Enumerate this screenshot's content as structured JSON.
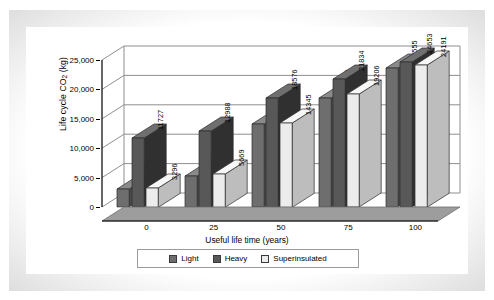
{
  "chart_data": {
    "type": "bar",
    "title": "",
    "xlabel": "Useful life time (years)",
    "ylabel": "Life cycle CO2 (kg)",
    "ylabel_parts": {
      "pre": "Life cycle CO",
      "sub": "2",
      "post": " (kg)"
    },
    "categories": [
      "0",
      "25",
      "50",
      "75",
      "100"
    ],
    "ylim": [
      0,
      25000
    ],
    "yticks": [
      "0",
      "5,000",
      "10,000",
      "15,000",
      "20,000",
      "25,000"
    ],
    "ytick_values": [
      0,
      5000,
      10000,
      15000,
      20000,
      25000
    ],
    "grid": true,
    "legend_position": "bottom",
    "projection": "3d-grouped-column",
    "series": [
      {
        "name": "Light",
        "color": "#6e6e6e",
        "values": [
          3050,
          11727,
          14095,
          18569,
          23555
        ]
      },
      {
        "name": "Heavy",
        "color": "#585858",
        "values": [
          11727,
          12988,
          18576,
          21834,
          24653
        ]
      },
      {
        "name": "Superinsulated",
        "color": "#ececec",
        "values": [
          3296,
          5669,
          14345,
          19206,
          24191
        ]
      }
    ],
    "groups": [
      {
        "category": "0",
        "bars": [
          {
            "series": "Light",
            "value": 3050,
            "label": "3050"
          },
          {
            "series": "Heavy",
            "value": 11727,
            "label": "11727"
          },
          {
            "series": "Superinsulated",
            "value": 3296,
            "label": "3296"
          }
        ]
      },
      {
        "category": "25",
        "bars": [
          {
            "series": "Light",
            "value": 5320,
            "label": "5320"
          },
          {
            "series": "Heavy",
            "value": 12988,
            "label": "12988"
          },
          {
            "series": "Superinsulated",
            "value": 5669,
            "label": "5669"
          }
        ]
      },
      {
        "category": "50",
        "bars": [
          {
            "series": "Light",
            "value": 14095,
            "label": "14095"
          },
          {
            "series": "Heavy",
            "value": 18576,
            "label": "18576"
          },
          {
            "series": "Superinsulated",
            "value": 14345,
            "label": "14345"
          }
        ]
      },
      {
        "category": "75",
        "bars": [
          {
            "series": "Light",
            "value": 18569,
            "label": "18569"
          },
          {
            "series": "Heavy",
            "value": 21834,
            "label": "21834"
          },
          {
            "series": "Superinsulated",
            "value": 19206,
            "label": "19206"
          }
        ]
      },
      {
        "category": "100",
        "bars": [
          {
            "series": "Light",
            "value": 23555,
            "label": "23555"
          },
          {
            "series": "Heavy",
            "value": 24653,
            "label": "24653"
          },
          {
            "series": "Superinsulated",
            "value": 24191,
            "label": "24191"
          }
        ]
      }
    ],
    "legend": [
      {
        "label": "Light",
        "color": "#6e6e6e"
      },
      {
        "label": "Heavy",
        "color": "#585858"
      },
      {
        "label": "Superinsulated",
        "color": "#ececec"
      }
    ]
  },
  "colors": {
    "bar_light_front": "#6e6e6e",
    "bar_light_side": "#4a4a4a",
    "bar_light_top": "#8a8a8a",
    "bar_heavy_front": "#585858",
    "bar_heavy_side": "#303030",
    "bar_heavy_top": "#6f6f6f",
    "bar_super_front": "#ececec",
    "bar_super_side": "#bdbdbd",
    "bar_super_top": "#f7f7f7",
    "floor": "#9d9d9d",
    "grid": "#8f8f8f",
    "axis": "#000000",
    "frame": "#9a9a9a",
    "background": "#ffffff"
  }
}
